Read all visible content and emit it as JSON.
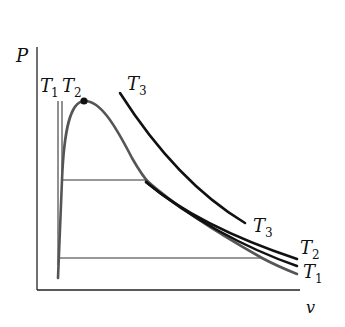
{
  "diagram": {
    "type": "P-v isotherm diagram",
    "axes": {
      "y_label": "P",
      "x_label": "v"
    },
    "isotherms": [
      {
        "name": "T1",
        "base": "T",
        "sub": "1",
        "color": "#555555"
      },
      {
        "name": "T2",
        "base": "T",
        "sub": "2",
        "color": "#111111"
      },
      {
        "name": "T3",
        "base": "T",
        "sub": "3",
        "color": "#111111"
      }
    ],
    "labels": {
      "t1_top": {
        "base": "T",
        "sub": "1"
      },
      "t2_top": {
        "base": "T",
        "sub": "2"
      },
      "t3_top": {
        "base": "T",
        "sub": "3"
      },
      "t3_right": {
        "base": "T",
        "sub": "3"
      },
      "t2_right": {
        "base": "T",
        "sub": "2"
      },
      "t1_right": {
        "base": "T",
        "sub": "1"
      }
    },
    "critical_point": {
      "marker": "dot"
    },
    "colors": {
      "axis": "#222222",
      "dome": "#555555",
      "isotherm_dark": "#111111",
      "tie_line": "#333333"
    }
  }
}
